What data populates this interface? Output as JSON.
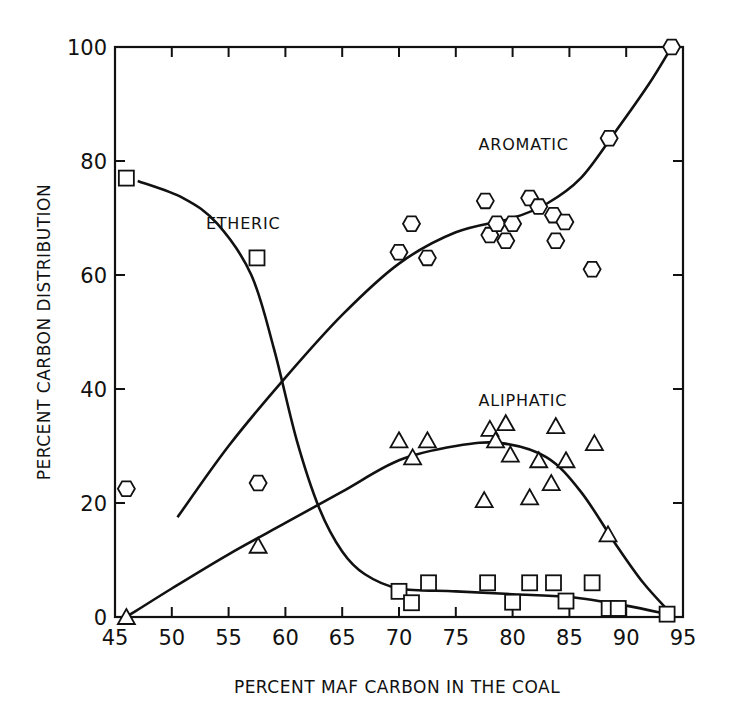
{
  "chart_data": {
    "type": "scatter",
    "title": "",
    "xlabel": "PERCENT MAF CARBON IN THE COAL",
    "ylabel": "PERCENT CARBON DISTRIBUTION",
    "xlim": [
      45,
      95
    ],
    "ylim": [
      0,
      100
    ],
    "x_ticks": [
      45,
      50,
      55,
      60,
      65,
      70,
      75,
      80,
      85,
      90,
      95
    ],
    "y_ticks": [
      0,
      20,
      40,
      60,
      80,
      100
    ],
    "grid": false,
    "legend": "none (series labeled inline)",
    "series": [
      {
        "name": "AROMATIC",
        "marker": "hexagon",
        "label_pos": [
          77,
          82
        ],
        "points": [
          [
            46,
            22.5
          ],
          [
            57.6,
            23.5
          ],
          [
            70,
            64
          ],
          [
            71.1,
            69
          ],
          [
            72.5,
            63
          ],
          [
            77.6,
            73
          ],
          [
            78,
            67
          ],
          [
            78.6,
            69
          ],
          [
            79.4,
            66
          ],
          [
            80,
            69
          ],
          [
            81.5,
            73.5
          ],
          [
            82.3,
            72
          ],
          [
            83.6,
            70.5
          ],
          [
            84.6,
            69.3
          ],
          [
            83.8,
            66
          ],
          [
            87,
            61
          ],
          [
            88.5,
            84
          ],
          [
            94,
            100
          ]
        ],
        "curve": [
          [
            50.5,
            17.5
          ],
          [
            55,
            30
          ],
          [
            60,
            42
          ],
          [
            65,
            53
          ],
          [
            70,
            62
          ],
          [
            75,
            67.5
          ],
          [
            80,
            70
          ],
          [
            83,
            72.5
          ],
          [
            86,
            77
          ],
          [
            89,
            85
          ],
          [
            92,
            93.5
          ],
          [
            94,
            100
          ]
        ]
      },
      {
        "name": "ALIPHATIC",
        "marker": "triangle",
        "label_pos": [
          77,
          37
        ],
        "points": [
          [
            46,
            0
          ],
          [
            57.6,
            12.5
          ],
          [
            70,
            31
          ],
          [
            71.2,
            28
          ],
          [
            72.5,
            31
          ],
          [
            77.5,
            20.5
          ],
          [
            78,
            33
          ],
          [
            78.5,
            31
          ],
          [
            79.4,
            34
          ],
          [
            79.8,
            28.5
          ],
          [
            81.5,
            21
          ],
          [
            82.3,
            27.5
          ],
          [
            83.4,
            23.5
          ],
          [
            83.8,
            33.5
          ],
          [
            84.7,
            27.5
          ],
          [
            87.2,
            30.5
          ],
          [
            88.4,
            14.5
          ]
        ],
        "curve": [
          [
            46,
            0
          ],
          [
            50,
            5
          ],
          [
            55,
            11
          ],
          [
            60,
            16.5
          ],
          [
            65,
            22
          ],
          [
            70,
            27.5
          ],
          [
            75,
            30
          ],
          [
            79,
            30.5
          ],
          [
            83,
            28
          ],
          [
            86,
            22
          ],
          [
            89,
            13
          ],
          [
            91.5,
            6
          ],
          [
            94,
            0.5
          ]
        ]
      },
      {
        "name": "ETHERIC",
        "marker": "square",
        "label_pos": [
          53,
          68
        ],
        "points": [
          [
            46,
            77
          ],
          [
            57.5,
            63
          ],
          [
            70,
            4.5
          ],
          [
            71.1,
            2.5
          ],
          [
            72.6,
            6
          ],
          [
            77.8,
            6
          ],
          [
            80,
            2.6
          ],
          [
            81.5,
            6
          ],
          [
            83.6,
            6
          ],
          [
            84.7,
            2.8
          ],
          [
            87,
            6
          ],
          [
            88.5,
            1.5
          ],
          [
            89.3,
            1.5
          ],
          [
            93.6,
            0.5
          ]
        ],
        "curve": [
          [
            47,
            76.5
          ],
          [
            51,
            73.5
          ],
          [
            54,
            69
          ],
          [
            57,
            60
          ],
          [
            59,
            47
          ],
          [
            61,
            31
          ],
          [
            63,
            19
          ],
          [
            65,
            11.5
          ],
          [
            67,
            7.5
          ],
          [
            70,
            5
          ],
          [
            75,
            4.5
          ],
          [
            80,
            4
          ],
          [
            85,
            3.5
          ],
          [
            90,
            2
          ],
          [
            93.6,
            0.5
          ]
        ]
      }
    ]
  }
}
